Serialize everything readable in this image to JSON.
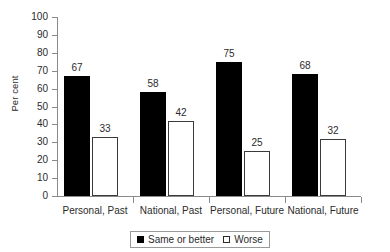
{
  "chart_data": {
    "type": "bar",
    "title": "",
    "xlabel": "",
    "ylabel": "Per cent",
    "ylim": [
      0,
      100
    ],
    "ytick_step": 10,
    "ytick_labels": [
      "100",
      "90",
      "80",
      "70",
      "60",
      "50",
      "40",
      "30",
      "20",
      "10",
      "0"
    ],
    "grid": false,
    "legend_position": "bottom-center",
    "categories": [
      "Personal, Past",
      "National, Past",
      "Personal, Future",
      "National, Future"
    ],
    "series": [
      {
        "name": "Same or better",
        "style": "filled",
        "color": "#000000",
        "values": [
          67,
          58,
          75,
          68
        ]
      },
      {
        "name": "Worse",
        "style": "open",
        "color": "#ffffff",
        "values": [
          33,
          42,
          25,
          32
        ]
      }
    ]
  },
  "legend": {
    "entries": [
      {
        "label": "Same or better",
        "swatch": "filled-square"
      },
      {
        "label": "Worse",
        "swatch": "open-square"
      }
    ]
  },
  "colors": {
    "axis": "#8a8a8a",
    "text": "#2b2b2b",
    "bar_filled": "#000000",
    "bar_open_fill": "#ffffff",
    "bar_open_stroke": "#3a3a3a",
    "legend_border": "#9a9a9a",
    "background": "#ffffff"
  }
}
